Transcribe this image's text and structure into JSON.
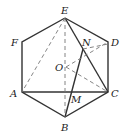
{
  "diagram": {
    "type": "geometry",
    "colors": {
      "line": "#333333",
      "dashed": "#888888",
      "background": "#ffffff"
    },
    "points": {
      "E": {
        "label": "E",
        "x": 65,
        "y": 18
      },
      "F": {
        "label": "F",
        "x": 22,
        "y": 42
      },
      "D": {
        "label": "D",
        "x": 108,
        "y": 42
      },
      "A": {
        "label": "A",
        "x": 22,
        "y": 92
      },
      "C": {
        "label": "C",
        "x": 108,
        "y": 92
      },
      "B": {
        "label": "B",
        "x": 65,
        "y": 117
      },
      "O": {
        "label": "O",
        "x": 66,
        "y": 67
      },
      "N": {
        "label": "N",
        "x": 83,
        "y": 49
      },
      "M": {
        "label": "M",
        "x": 70,
        "y": 92
      }
    },
    "solid_segments": [
      "EF",
      "FA",
      "AB",
      "BC",
      "CD",
      "DE",
      "AC",
      "EC",
      "BN"
    ],
    "dashed_segments": [
      "EA",
      "EB",
      "OD",
      "OC",
      "ND"
    ]
  }
}
